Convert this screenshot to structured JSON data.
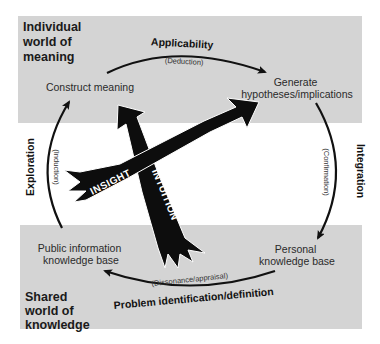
{
  "diagram": {
    "regions": {
      "top": {
        "title_lines": [
          "Individual",
          "world of",
          "meaning"
        ]
      },
      "bottom": {
        "title_lines": [
          "Shared",
          "world of",
          "knowledge"
        ]
      }
    },
    "nodes": {
      "construct_meaning": "Construct meaning",
      "generate": {
        "lines": [
          "Generate",
          "hypotheses/implications"
        ]
      },
      "personal_kb": {
        "lines": [
          "Personal",
          "knowledge base"
        ]
      },
      "public_kb": {
        "lines": [
          "Public information",
          "knowledge base"
        ]
      }
    },
    "processes": {
      "applicability": {
        "label": "Applicability",
        "sub": "(Deduction)"
      },
      "integration": {
        "label": "Integration",
        "sub": "(Confirmation)"
      },
      "problem": {
        "label": "Problem identification/definition",
        "sub": "(Dissonance/appraisal)"
      },
      "exploration": {
        "label": "Exploration",
        "sub": "(Induction)"
      }
    },
    "arrows": {
      "insight": "INSIGHT",
      "intuition": "INTUITION"
    },
    "colors": {
      "region_fill": "#d4d4d4",
      "arrow_fill": "#0d0d0d",
      "background": "#ffffff"
    }
  }
}
